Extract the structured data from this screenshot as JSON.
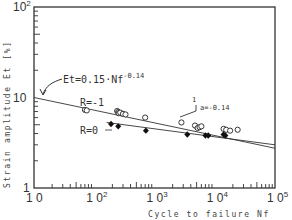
{
  "chart_data": {
    "type": "scatter",
    "title": "",
    "xlabel": "Cycle to failure Nf",
    "ylabel": "Strain amplitude Et [%]",
    "xscale": "log",
    "yscale": "log",
    "xlim": [
      10,
      100000
    ],
    "ylim": [
      1,
      100
    ],
    "grid": false,
    "x_ticks": [
      {
        "value": 10,
        "base": "10",
        "exp": ""
      },
      {
        "value": 100,
        "base": "10",
        "exp": "2"
      },
      {
        "value": 1000,
        "base": "10",
        "exp": "3"
      },
      {
        "value": 10000,
        "base": "10",
        "exp": "4"
      },
      {
        "value": 100000,
        "base": "10",
        "exp": "5"
      }
    ],
    "y_ticks": [
      {
        "value": 1,
        "base": "1",
        "exp": ""
      },
      {
        "value": 10,
        "base": "10",
        "exp": ""
      },
      {
        "value": 100,
        "base": "10",
        "exp": "2"
      }
    ],
    "series": [
      {
        "name": "R=-1",
        "marker": "open-circle",
        "points": [
          [
            70,
            7.3
          ],
          [
            75,
            7.2
          ],
          [
            240,
            7.1
          ],
          [
            250,
            6.9
          ],
          [
            255,
            6.7
          ],
          [
            270,
            6.8
          ],
          [
            300,
            6.6
          ],
          [
            330,
            6.5
          ],
          [
            700,
            6.0
          ],
          [
            2800,
            5.3
          ],
          [
            4700,
            4.9
          ],
          [
            5200,
            4.6
          ],
          [
            5600,
            4.7
          ],
          [
            6000,
            4.8
          ],
          [
            14000,
            4.5
          ],
          [
            15500,
            4.4
          ],
          [
            18000,
            4.3
          ],
          [
            24000,
            4.4
          ]
        ],
        "fit_line": {
          "from": [
            10,
            10.0
          ],
          "to": [
            100000,
            2.75
          ]
        }
      },
      {
        "name": "R=0",
        "marker": "filled-diamond",
        "points": [
          [
            190,
            5.1
          ],
          [
            250,
            4.8
          ],
          [
            720,
            4.3
          ],
          [
            3500,
            3.9
          ],
          [
            7000,
            3.8
          ],
          [
            7800,
            3.8
          ],
          [
            14000,
            3.9
          ],
          [
            15000,
            3.8
          ]
        ],
        "fit_line": {
          "from": [
            160,
            5.3
          ],
          "to": [
            100000,
            3.0
          ]
        }
      }
    ],
    "annotations": [
      {
        "text": "Et=0.15·Nf",
        "exp": "-0.14",
        "arrow_to": [
          10,
          10.0
        ]
      },
      {
        "text": "R=-1"
      },
      {
        "text": "R=0"
      },
      {
        "text": "1",
        "role": "slope-triangle-run"
      },
      {
        "text": "a=-0.14",
        "role": "slope-label"
      }
    ]
  }
}
